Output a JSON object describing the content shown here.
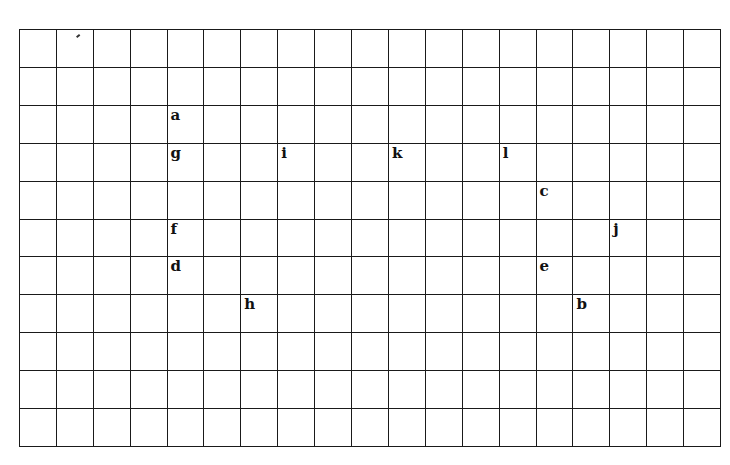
{
  "grid": {
    "columns": 19,
    "rows": 11,
    "line_color": "#1a1a1a",
    "labels": [
      {
        "letter": "a",
        "col": 4,
        "row": 2
      },
      {
        "letter": "g",
        "col": 4,
        "row": 3
      },
      {
        "letter": "i",
        "col": 7,
        "row": 3
      },
      {
        "letter": "k",
        "col": 10,
        "row": 3
      },
      {
        "letter": "l",
        "col": 13,
        "row": 3
      },
      {
        "letter": "c",
        "col": 14,
        "row": 4
      },
      {
        "letter": "f",
        "col": 4,
        "row": 5
      },
      {
        "letter": "j",
        "col": 16,
        "row": 5
      },
      {
        "letter": "d",
        "col": 4,
        "row": 6
      },
      {
        "letter": "e",
        "col": 14,
        "row": 6
      },
      {
        "letter": "h",
        "col": 6,
        "row": 7
      },
      {
        "letter": "b",
        "col": 15,
        "row": 7
      }
    ]
  }
}
